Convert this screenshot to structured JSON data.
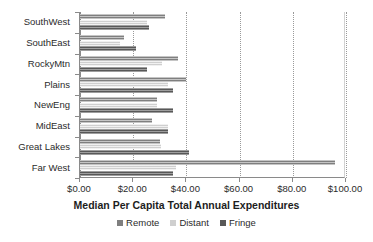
{
  "chart_data": {
    "type": "bar",
    "orientation": "horizontal",
    "title": "",
    "xlabel": "Median Per Capita Total Annual Expenditures",
    "ylabel": "",
    "xlim": [
      0,
      100
    ],
    "xticks": [
      0,
      20,
      40,
      60,
      80,
      100
    ],
    "xticklabels": [
      "$0.00",
      "$20.00",
      "$40.00",
      "$60.00",
      "$80.00",
      "$100.00"
    ],
    "grid": true,
    "grid_axis": "x",
    "legend_position": "bottom",
    "categories": [
      "SouthWest",
      "SouthEast",
      "RockyMtn",
      "Plains",
      "NewEng",
      "MidEast",
      "Great Lakes",
      "Far West"
    ],
    "series": [
      {
        "name": "Remote",
        "color": "#7f7f7f",
        "values": [
          32.0,
          16.5,
          37.0,
          40.0,
          29.0,
          27.0,
          30.0,
          96.0
        ]
      },
      {
        "name": "Distant",
        "color": "#cfcfcf",
        "values": [
          25.0,
          15.0,
          31.0,
          33.0,
          29.0,
          33.0,
          30.5,
          36.0
        ]
      },
      {
        "name": "Fringe",
        "color": "#585858",
        "values": [
          26.0,
          21.0,
          25.0,
          35.0,
          35.0,
          33.0,
          41.0,
          35.0
        ]
      }
    ]
  },
  "legend": {
    "items": [
      {
        "label": "Remote"
      },
      {
        "label": "Distant"
      },
      {
        "label": "Fringe"
      }
    ]
  }
}
